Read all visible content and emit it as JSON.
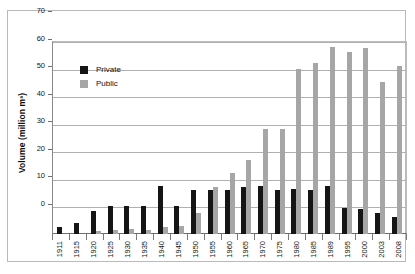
{
  "chart_data": {
    "type": "bar",
    "title": "",
    "xlabel": "",
    "ylabel": "Volume (million m³)",
    "ylim": [
      0,
      70
    ],
    "yticks": [
      0,
      10,
      20,
      30,
      40,
      50,
      60,
      70
    ],
    "grid": true,
    "legend_position": "upper-left-inside",
    "categories": [
      "1911",
      "1915",
      "1920",
      "1925",
      "1930",
      "1935",
      "1940",
      "1945",
      "1950",
      "1955",
      "1960",
      "1965",
      "1970",
      "1975",
      "1980",
      "1985",
      "1989",
      "1995",
      "2000",
      "2003",
      "2008"
    ],
    "series": [
      {
        "name": "Private",
        "color": "#151515",
        "values": [
          2.5,
          4.0,
          8.5,
          10.0,
          10.0,
          10.0,
          17.5,
          10.0,
          16.0,
          16.0,
          16.0,
          17.0,
          17.5,
          16.0,
          16.5,
          16.0,
          17.5,
          9.5,
          9.0,
          7.5,
          6.0
        ]
      },
      {
        "name": "Public",
        "color": "#a6a6a6",
        "values": [
          0.0,
          0.0,
          1.0,
          1.5,
          2.0,
          1.5,
          2.5,
          3.0,
          7.5,
          17.0,
          22.0,
          27.0,
          38.0,
          38.0,
          60.0,
          62.0,
          68.0,
          66.0,
          67.5,
          55.0,
          61.0
        ]
      }
    ]
  },
  "legend": {
    "items": [
      {
        "label": "Private",
        "color": "#151515"
      },
      {
        "label": "Public",
        "color": "#a6a6a6"
      }
    ]
  },
  "axis": {
    "y_title": "Volume (million m³)"
  }
}
